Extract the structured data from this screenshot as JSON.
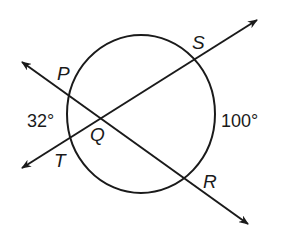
{
  "diagram": {
    "type": "circle-with-intersecting-secants",
    "circle": {
      "cx": 141,
      "cy": 114,
      "rx": 74,
      "ry": 79,
      "stroke": "#1a1a1a"
    },
    "lines": [
      {
        "name": "line-PR",
        "from": [
          22,
          62
        ],
        "to": [
          248,
          224
        ],
        "arrows": "both"
      },
      {
        "name": "line-TS",
        "from": [
          22,
          168
        ],
        "to": [
          257,
          20
        ],
        "arrows": "both"
      }
    ],
    "points": {
      "P": {
        "label": "P",
        "x": 57,
        "y": 80
      },
      "S": {
        "label": "S",
        "x": 192,
        "y": 48
      },
      "Q": {
        "label": "Q",
        "x": 90,
        "y": 140
      },
      "T": {
        "label": "T",
        "x": 54,
        "y": 167
      },
      "R": {
        "label": "R",
        "x": 203,
        "y": 187
      }
    },
    "arcs": {
      "PT": {
        "label": "32°",
        "x": 28,
        "y": 127
      },
      "SR": {
        "label": "100°",
        "x": 222,
        "y": 127
      }
    },
    "colors": {
      "stroke": "#1a1a1a",
      "background": "#ffffff"
    }
  }
}
